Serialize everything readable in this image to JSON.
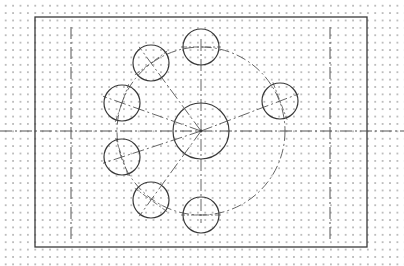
{
  "drawing": {
    "type": "CAD bolt-circle flange sketch",
    "colors": {
      "line": "#3a3a3a",
      "centerline": "#555555",
      "grid_dot": "#bdbdbd",
      "background": "#ffffff"
    },
    "border_rect": {
      "x": 35,
      "y": 17,
      "width": 332,
      "height": 230
    },
    "center": {
      "x": 201,
      "y": 131
    },
    "central_circle_radius": 28,
    "pitch_circle_radius": 84,
    "hole_radius": 18,
    "holes": [
      {
        "x": 201,
        "y": 47
      },
      {
        "x": 151,
        "y": 63
      },
      {
        "x": 122,
        "y": 103
      },
      {
        "x": 122,
        "y": 157
      },
      {
        "x": 151,
        "y": 200
      },
      {
        "x": 201,
        "y": 215
      },
      {
        "x": 280,
        "y": 101
      }
    ],
    "vertical_centerlines": [
      {
        "x": 71,
        "y1": 27,
        "y2": 240
      },
      {
        "x": 330,
        "y1": 27,
        "y2": 240
      }
    ],
    "horizontal_centerline": {
      "y": 131,
      "x1": 0,
      "x2": 404
    }
  }
}
